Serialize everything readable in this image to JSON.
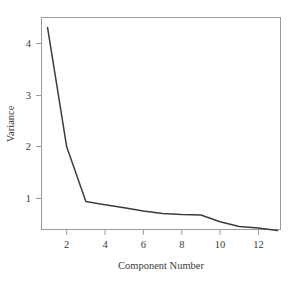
{
  "chart_data": {
    "type": "line",
    "title": "",
    "xlabel": "Component Number",
    "ylabel": "Variance",
    "x": [
      1,
      2,
      3,
      4,
      5,
      6,
      7,
      8,
      9,
      10,
      11,
      12,
      13
    ],
    "values": [
      4.31,
      2.0,
      0.94,
      0.88,
      0.82,
      0.76,
      0.71,
      0.69,
      0.68,
      0.55,
      0.46,
      0.43,
      0.38
    ],
    "series": [
      {
        "name": "Variance",
        "values": [
          4.31,
          2.0,
          0.94,
          0.88,
          0.82,
          0.76,
          0.71,
          0.69,
          0.68,
          0.55,
          0.46,
          0.43,
          0.38
        ]
      }
    ],
    "xticks": [
      2,
      4,
      6,
      8,
      10,
      12
    ],
    "xticklabels": [
      "2",
      "4",
      "6",
      "8",
      "10",
      "12"
    ],
    "yticks": [
      1,
      2,
      3,
      4
    ],
    "yticklabels": [
      "1",
      "2",
      "3",
      "4"
    ],
    "xlim": [
      0.6,
      13.4
    ],
    "ylim": [
      0.17,
      4.43
    ],
    "grid": false,
    "legend": false,
    "line_color": "#3c3c3c",
    "frame_color": "#9a9a9a",
    "text_color": "#3a3a3a"
  },
  "axes": {
    "y_title": "Variance",
    "x_title": "Component Number",
    "y_tick_labels": [
      "1",
      "2",
      "3",
      "4"
    ],
    "x_tick_labels": [
      "2",
      "4",
      "6",
      "8",
      "10",
      "12"
    ]
  }
}
